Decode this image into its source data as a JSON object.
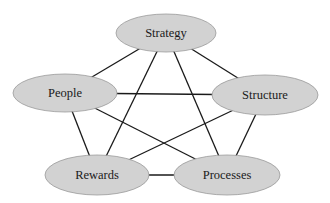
{
  "diagram": {
    "type": "network",
    "nodes": [
      {
        "id": "strategy",
        "label": "Strategy"
      },
      {
        "id": "people",
        "label": "People"
      },
      {
        "id": "structure",
        "label": "Structure"
      },
      {
        "id": "rewards",
        "label": "Rewards"
      },
      {
        "id": "processes",
        "label": "Processes"
      }
    ],
    "edges": [
      [
        "strategy",
        "people"
      ],
      [
        "strategy",
        "structure"
      ],
      [
        "strategy",
        "rewards"
      ],
      [
        "strategy",
        "processes"
      ],
      [
        "people",
        "structure"
      ],
      [
        "people",
        "rewards"
      ],
      [
        "people",
        "processes"
      ],
      [
        "structure",
        "rewards"
      ],
      [
        "structure",
        "processes"
      ],
      [
        "rewards",
        "processes"
      ]
    ],
    "colors": {
      "node_fill": "#d2d2d2",
      "edge": "#1a1a1a",
      "text": "#1a1a1a"
    }
  }
}
